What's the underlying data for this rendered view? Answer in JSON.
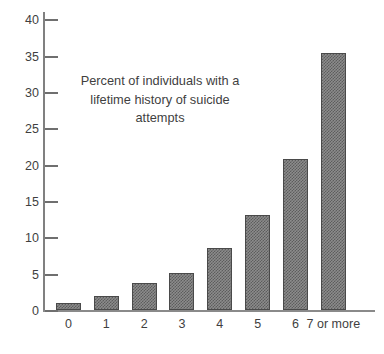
{
  "chart_data": {
    "type": "bar",
    "title_lines": [
      "Percent of individuals with a",
      "lifetime history of suicide",
      "attempts"
    ],
    "xlabel": "",
    "ylabel": "",
    "categories": [
      "0",
      "1",
      "2",
      "3",
      "4",
      "5",
      "6",
      "7 or more"
    ],
    "values": [
      1.0,
      1.9,
      3.7,
      5.1,
      8.6,
      13.1,
      20.8,
      35.3
    ],
    "ylim": [
      0,
      41
    ],
    "yticks": [
      0,
      5,
      10,
      15,
      20,
      25,
      30,
      35,
      40
    ],
    "ytick_labels": [
      "0",
      "5",
      "10",
      "15",
      "20",
      "25",
      "30",
      "35",
      "40"
    ],
    "grid": false,
    "legend": null,
    "series": [
      {
        "name": "Percent of individuals with a lifetime history of suicide attempts",
        "values": [
          1.0,
          1.9,
          3.7,
          5.1,
          8.6,
          13.1,
          20.8,
          35.3
        ]
      }
    ]
  },
  "style": {
    "bar_fill": "#8c8c8c",
    "bar_pattern": "#5d5d5d",
    "bar_border": "#4a4a4a",
    "axis_color": "#808080",
    "text_color": "#3f3f3f",
    "background": "#ffffff"
  }
}
